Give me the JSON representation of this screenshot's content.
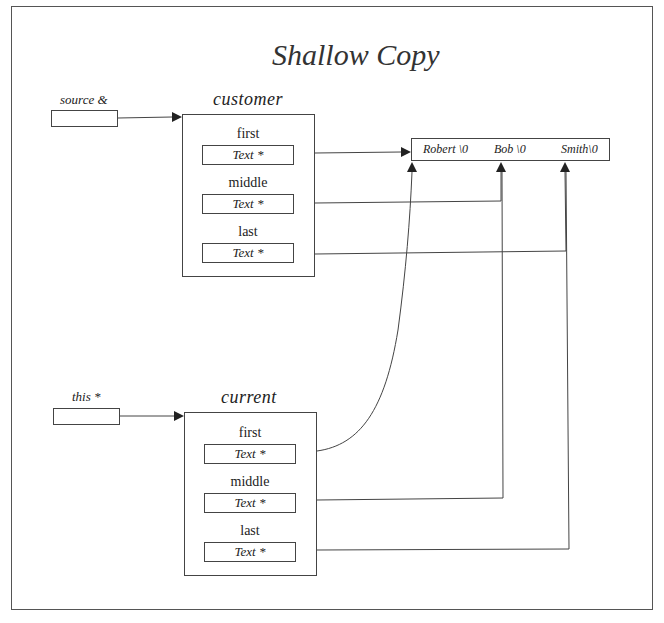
{
  "title": "Shallow Copy",
  "references": [
    {
      "name": "source",
      "label": "source &"
    },
    {
      "name": "this",
      "label": "this *"
    }
  ],
  "objects": [
    {
      "name": "customer",
      "label": "customer",
      "fields": [
        {
          "name": "first",
          "label": "first",
          "type": "Text *"
        },
        {
          "name": "middle",
          "label": "middle",
          "type": "Text *"
        },
        {
          "name": "last",
          "label": "last",
          "type": "Text *"
        }
      ]
    },
    {
      "name": "current",
      "label": "current",
      "fields": [
        {
          "name": "first",
          "label": "first",
          "type": "Text *"
        },
        {
          "name": "middle",
          "label": "middle",
          "type": "Text *"
        },
        {
          "name": "last",
          "label": "last",
          "type": "Text *"
        }
      ]
    }
  ],
  "string_buffer": {
    "segments": [
      "Robert \\0",
      "Bob \\0",
      "Smith\\0"
    ]
  },
  "colors": {
    "line": "#444444",
    "frame": "#555555",
    "background": "#ffffff"
  }
}
